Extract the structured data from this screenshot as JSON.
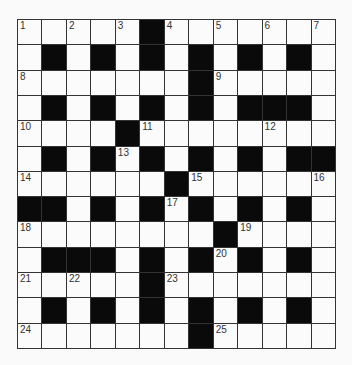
{
  "puzzle": {
    "rows": 13,
    "cols": 13,
    "layout": [
      "WWWWWBWWWWWWW",
      "WBWBWBWBWBWBW",
      "WWWWWWWBWWWWW",
      "WBWBWBWBWBBBW",
      "WWWWBWWWWWWWW",
      "WBWBWBWBWBWBB",
      "WWWWWWBWWWWWW",
      "BBWBWBWBWBWBW",
      "WWWWWWWWBWWWW",
      "WBBBWBWBWBWBW",
      "WWWWWBWWWWWWW",
      "WBWBWBWBWBWBW",
      "WWWWWWWBWWWWW"
    ],
    "numbers": [
      {
        "r": 0,
        "c": 0,
        "n": "1"
      },
      {
        "r": 0,
        "c": 2,
        "n": "2"
      },
      {
        "r": 0,
        "c": 4,
        "n": "3"
      },
      {
        "r": 0,
        "c": 6,
        "n": "4"
      },
      {
        "r": 0,
        "c": 8,
        "n": "5"
      },
      {
        "r": 0,
        "c": 10,
        "n": "6"
      },
      {
        "r": 0,
        "c": 12,
        "n": "7"
      },
      {
        "r": 2,
        "c": 0,
        "n": "8"
      },
      {
        "r": 2,
        "c": 8,
        "n": "9"
      },
      {
        "r": 4,
        "c": 0,
        "n": "10"
      },
      {
        "r": 4,
        "c": 5,
        "n": "11"
      },
      {
        "r": 4,
        "c": 10,
        "n": "12"
      },
      {
        "r": 5,
        "c": 4,
        "n": "13"
      },
      {
        "r": 6,
        "c": 0,
        "n": "14"
      },
      {
        "r": 6,
        "c": 7,
        "n": "15"
      },
      {
        "r": 6,
        "c": 12,
        "n": "16"
      },
      {
        "r": 7,
        "c": 6,
        "n": "17"
      },
      {
        "r": 8,
        "c": 0,
        "n": "18"
      },
      {
        "r": 8,
        "c": 9,
        "n": "19"
      },
      {
        "r": 9,
        "c": 8,
        "n": "20"
      },
      {
        "r": 10,
        "c": 0,
        "n": "21"
      },
      {
        "r": 10,
        "c": 2,
        "n": "22"
      },
      {
        "r": 10,
        "c": 6,
        "n": "23"
      },
      {
        "r": 12,
        "c": 0,
        "n": "24"
      },
      {
        "r": 12,
        "c": 8,
        "n": "25"
      }
    ]
  }
}
